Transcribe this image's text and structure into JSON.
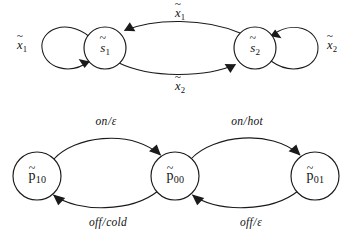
{
  "figure": {
    "type": "state-transition-diagrams",
    "background_color": "#ffffff",
    "stroke_color": "#1a1a1a"
  },
  "diagrams": [
    {
      "id": "top",
      "name": "state-machine-s",
      "nodes": [
        {
          "id": "s1",
          "base": "s",
          "accent": "~",
          "subscript": "1",
          "cx": 105,
          "cy": 48,
          "r": 21
        },
        {
          "id": "s2",
          "base": "s",
          "accent": "~",
          "subscript": "2",
          "cx": 255,
          "cy": 48,
          "r": 21
        }
      ],
      "edges": [
        {
          "id": "s1-self",
          "from": "s1",
          "to": "s1",
          "kind": "self-loop-left",
          "label": {
            "base": "x",
            "accent": "~",
            "subscript": "1"
          },
          "label_x": 22,
          "label_y": 45
        },
        {
          "id": "s2-self",
          "from": "s2",
          "to": "s2",
          "kind": "self-loop-right",
          "label": {
            "base": "x",
            "accent": "~",
            "subscript": "2"
          },
          "label_x": 332,
          "label_y": 45
        },
        {
          "id": "s2-to-s1",
          "from": "s2",
          "to": "s1",
          "kind": "arc-top",
          "label": {
            "base": "x",
            "accent": "~",
            "subscript": "1"
          },
          "label_x": 180,
          "label_y": 13
        },
        {
          "id": "s1-to-s2",
          "from": "s1",
          "to": "s2",
          "kind": "arc-bottom",
          "label": {
            "base": "x",
            "accent": "~",
            "subscript": "2"
          },
          "label_x": 180,
          "label_y": 86
        }
      ]
    },
    {
      "id": "bottom",
      "name": "state-machine-p",
      "nodes": [
        {
          "id": "p10",
          "base": "p",
          "accent": "~",
          "subscript": "10",
          "cx": 37,
          "cy": 176,
          "r": 24
        },
        {
          "id": "p00",
          "base": "p",
          "accent": "~",
          "subscript": "00",
          "cx": 175,
          "cy": 176,
          "r": 24
        },
        {
          "id": "p01",
          "base": "p",
          "accent": "~",
          "subscript": "01",
          "cx": 315,
          "cy": 176,
          "r": 24
        }
      ],
      "edges": [
        {
          "id": "p10-to-p00",
          "from": "p10",
          "to": "p00",
          "kind": "arc-top",
          "input": "on",
          "separator": "/",
          "output": "ε",
          "label_x": 106,
          "label_y": 122
        },
        {
          "id": "p00-to-p01",
          "from": "p00",
          "to": "p01",
          "kind": "arc-top",
          "input": "on",
          "separator": "/",
          "output": "hot",
          "label_x": 247,
          "label_y": 122
        },
        {
          "id": "p00-to-p10",
          "from": "p00",
          "to": "p10",
          "kind": "arc-bottom",
          "input": "off",
          "separator": "/",
          "output": "cold",
          "label_x": 108,
          "label_y": 223
        },
        {
          "id": "p01-to-p00",
          "from": "p01",
          "to": "p00",
          "kind": "arc-bottom",
          "input": "off",
          "separator": "/",
          "output": "ε",
          "label_x": 251,
          "label_y": 223
        }
      ]
    }
  ]
}
